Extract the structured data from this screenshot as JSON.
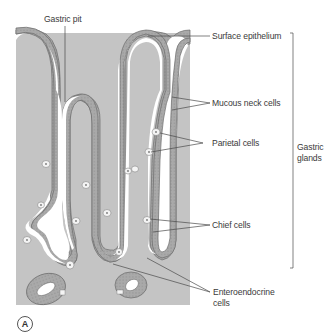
{
  "figure": {
    "panel_label": "A",
    "colors": {
      "tissue": "#c2c2c2",
      "epithelium": "#a8a8a8",
      "epithelium_border": "#6a6a6a",
      "lumen": "#ffffff",
      "special_cell": "#f4f4f4",
      "leader_line": "#4a4a4a",
      "text": "#3a3a3a"
    },
    "labels": {
      "gastric_pit": "Gastric pit",
      "surface_epithelium": "Surface epithelium",
      "mucous_neck_cells": "Mucous neck cells",
      "parietal_cells": "Parietal cells",
      "chief_cells": "Chief cells",
      "enteroendocrine_line1": "Enteroendocrine",
      "enteroendocrine_line2": "cells",
      "gastric_glands_line1": "Gastric",
      "gastric_glands_line2": "glands"
    }
  }
}
